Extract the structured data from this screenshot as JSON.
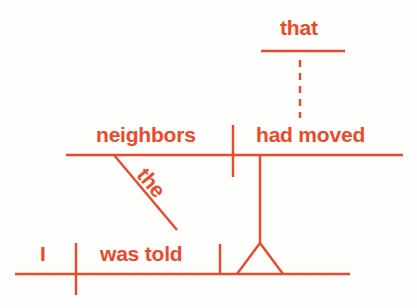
{
  "diagram": {
    "type": "sentence-diagram",
    "sentence": "I was told that the neighbors had moved",
    "color": "#ea4a2c",
    "background": "#fdfdfb",
    "words": {
      "subject_main": "I",
      "verb_main": "was told",
      "connector": "that",
      "subject_clause": "neighbors",
      "verb_clause": "had moved",
      "modifier": "the"
    }
  }
}
